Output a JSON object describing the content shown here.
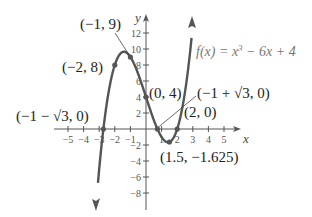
{
  "chart_data": {
    "type": "line",
    "title": "",
    "function_label": "f(x) = x³ − 6x + 4",
    "function_label_parts": {
      "pre": "f(x) = x",
      "exp": "3",
      "post": " − 6x + 4"
    },
    "xlabel": "x",
    "ylabel": "y",
    "xlim": [
      -5.8,
      6
    ],
    "ylim": [
      -10,
      14
    ],
    "grid": false,
    "x_ticks": [
      -5,
      -4,
      -3,
      -2,
      -1,
      1,
      2,
      3,
      4,
      5
    ],
    "x_tick_labels": [
      "−5",
      "−4",
      "−3",
      "−2",
      "−1",
      "1",
      "2",
      "3",
      "4",
      "5"
    ],
    "y_ticks": [
      12,
      10,
      8,
      6,
      4,
      2,
      -2,
      -4,
      -6,
      -8
    ],
    "y_tick_labels": [
      "12",
      "10",
      "8",
      "6",
      "4",
      "2",
      "−2",
      "−4",
      "−6",
      "−8"
    ],
    "series": [
      {
        "name": "f(x) = x^3 - 6x + 4",
        "x_range": [
          -3.2,
          3.0
        ],
        "color": "#555555"
      }
    ],
    "points": [
      {
        "x": -1,
        "y": 9,
        "label": "(−1, 9)"
      },
      {
        "x": -2,
        "y": 8,
        "label": "(−2, 8)"
      },
      {
        "x": 0,
        "y": 4,
        "label": "(0, 4)"
      },
      {
        "x": -2.732,
        "y": 0,
        "label": "(−1 − √3, 0)"
      },
      {
        "x": 0.732,
        "y": 0,
        "label": "(−1 + √3, 0)"
      },
      {
        "x": 2,
        "y": 0,
        "label": "(2, 0)"
      },
      {
        "x": 1.5,
        "y": -1.625,
        "label": "(1.5, −1.625)"
      }
    ]
  }
}
